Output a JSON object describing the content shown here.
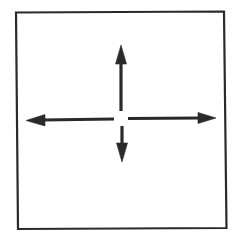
{
  "diagram": {
    "stroke_color": "#2a2a2a",
    "background": "#ffffff",
    "frame": {
      "x1": 15,
      "y1": 12,
      "x2": 226,
      "y2": 228
    },
    "center": {
      "x": 121,
      "y": 119
    },
    "arrows": [
      {
        "direction": "up",
        "icon": "arrow-up-icon"
      },
      {
        "direction": "down",
        "icon": "arrow-down-icon"
      },
      {
        "direction": "left",
        "icon": "arrow-left-icon"
      },
      {
        "direction": "right",
        "icon": "arrow-right-icon"
      }
    ]
  }
}
